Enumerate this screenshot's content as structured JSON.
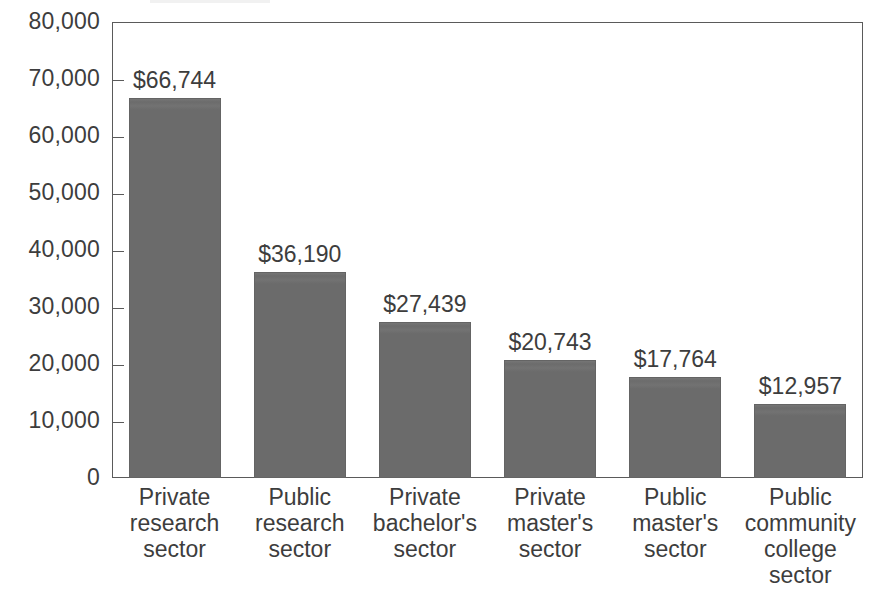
{
  "chart_data": {
    "type": "bar",
    "title": "",
    "subtitle": "",
    "xlabel": "",
    "ylabel": "",
    "categories": [
      "Private research sector",
      "Public research sector",
      "Private bachelor's sector",
      "Private master's sector",
      "Public master's sector",
      "Public community college sector"
    ],
    "category_lines": [
      [
        "Private",
        "research",
        "sector"
      ],
      [
        "Public",
        "research",
        "sector"
      ],
      [
        "Private",
        "bachelor's",
        "sector"
      ],
      [
        "Private",
        "master's",
        "sector"
      ],
      [
        "Public",
        "master's",
        "sector"
      ],
      [
        "Public",
        "community",
        "college",
        "sector"
      ]
    ],
    "values": [
      66744,
      36190,
      27439,
      20743,
      17764,
      12957
    ],
    "value_labels": [
      "$66,744",
      "$36,190",
      "$27,439",
      "$20,743",
      "$17,764",
      "$12,957"
    ],
    "ylim": [
      0,
      80000
    ],
    "ytick_values": [
      0,
      10000,
      20000,
      30000,
      40000,
      50000,
      60000,
      70000,
      80000
    ],
    "ytick_labels": [
      "0",
      "10,000",
      "20,000",
      "30,000",
      "40,000",
      "50,000",
      "60,000",
      "70,000",
      "80,000"
    ],
    "grid": false,
    "legend": false,
    "legend_position": "none",
    "bar_color": "#6e6e6e",
    "axis_color": "#5a5a5a",
    "text_color": "#3d3d3d",
    "background_color": "#ffffff"
  }
}
